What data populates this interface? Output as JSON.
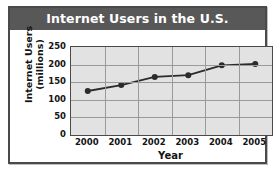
{
  "chart_data": {
    "type": "line",
    "title": "Internet Users in the U.S.",
    "xlabel": "Year",
    "ylabel": "Internet Users\n(millions)",
    "categories": [
      "2000",
      "2001",
      "2002",
      "2003",
      "2004",
      "2005"
    ],
    "values": [
      125,
      142,
      165,
      170,
      198,
      202
    ],
    "series": [
      {
        "name": "Internet Users",
        "values": [
          125,
          142,
          165,
          170,
          198,
          202
        ]
      }
    ],
    "ylim": [
      0,
      250
    ],
    "yticks": [
      "0",
      "50",
      "100",
      "150",
      "200",
      "250"
    ],
    "ytick_values": [
      0,
      50,
      100,
      150,
      200,
      250
    ],
    "grid": true,
    "legend": "none",
    "colors": {
      "title_band": "#585858",
      "title_text": "#ffffff",
      "plot_background": "#e2e2e2",
      "gridline": "#9a9a9a",
      "axis": "#4a4a4a",
      "series_line": "#2b2b2b",
      "marker": "#2b2b2b",
      "page_background": "#ffffff",
      "text": "#141414"
    }
  }
}
